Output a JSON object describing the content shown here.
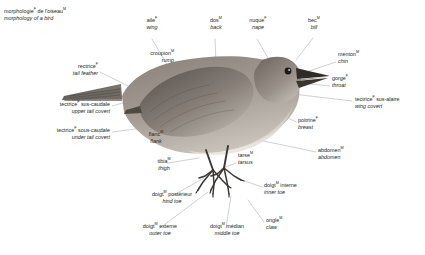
{
  "title": {
    "fr": "morphologie",
    "fr_gender": "F",
    "fr_rest": " de l'oiseau",
    "fr_gender2": "M",
    "en": "morphology of a bird"
  },
  "colors": {
    "text": "#231f20",
    "leader_line": "#a7a9ac",
    "bird_dark": "#4a4440",
    "bird_mid": "#7c736c",
    "bird_light": "#b8b2ab",
    "bird_pale": "#d8d4cf",
    "eye": "#1a1a1a"
  },
  "labels": [
    {
      "id": "aile",
      "fr": "aile",
      "fr_sup": "F",
      "fr_rest": "",
      "en": "wing",
      "align": "center"
    },
    {
      "id": "dos",
      "fr": "dos",
      "fr_sup": "M",
      "fr_rest": "",
      "en": "back",
      "align": "center"
    },
    {
      "id": "nuque",
      "fr": "nuque",
      "fr_sup": "F",
      "fr_rest": "",
      "en": "nape",
      "align": "center"
    },
    {
      "id": "bec",
      "fr": "bec",
      "fr_sup": "M",
      "fr_rest": "",
      "en": "bill",
      "align": "center"
    },
    {
      "id": "menton",
      "fr": "menton",
      "fr_sup": "M",
      "fr_rest": "",
      "en": "chin",
      "align": "left"
    },
    {
      "id": "gorge",
      "fr": "gorge",
      "fr_sup": "F",
      "fr_rest": "",
      "en": "throat",
      "align": "left"
    },
    {
      "id": "tectrice-sus-alaire",
      "fr": "tectrice",
      "fr_sup": "F",
      "fr_rest": " sus-alaire",
      "en": "wing covert",
      "align": "left"
    },
    {
      "id": "poitrine",
      "fr": "poitrine",
      "fr_sup": "F",
      "fr_rest": "",
      "en": "breast",
      "align": "left"
    },
    {
      "id": "abdomen",
      "fr": "abdomen",
      "fr_sup": "M",
      "fr_rest": "",
      "en": "abdomen",
      "align": "left"
    },
    {
      "id": "doigt-interne",
      "fr": "doigt",
      "fr_sup": "M",
      "fr_rest": " interne",
      "en": "inner toe",
      "align": "left"
    },
    {
      "id": "ongle",
      "fr": "ongle",
      "fr_sup": "M",
      "fr_rest": "",
      "en": "claw",
      "align": "left"
    },
    {
      "id": "doigt-median",
      "fr": "doigt",
      "fr_sup": "M",
      "fr_rest": " médian",
      "en": "middle toe",
      "align": "center"
    },
    {
      "id": "doigt-externe",
      "fr": "doigt",
      "fr_sup": "M",
      "fr_rest": " externe",
      "en": "outer toe",
      "align": "center"
    },
    {
      "id": "doigt-posterieur",
      "fr": "doigt",
      "fr_sup": "M",
      "fr_rest": " postérieur",
      "en": "hind toe",
      "align": "center"
    },
    {
      "id": "tibia",
      "fr": "tibia",
      "fr_sup": "M",
      "fr_rest": "",
      "en": "thigh",
      "align": "center"
    },
    {
      "id": "tarse",
      "fr": "tarse",
      "fr_sup": "M",
      "fr_rest": "",
      "en": "tarsus",
      "align": "left"
    },
    {
      "id": "flanc",
      "fr": "flanc",
      "fr_sup": "M",
      "fr_rest": "",
      "en": "flank",
      "align": "center"
    },
    {
      "id": "tectrice-sous-caudale",
      "fr": "tectrice",
      "fr_sup": "F",
      "fr_rest": " sous-caudale",
      "en": "under tail covert",
      "align": "right"
    },
    {
      "id": "tectrice-sus-caudale",
      "fr": "tectrice",
      "fr_sup": "F",
      "fr_rest": " sus-caudale",
      "en": "upper tail covert",
      "align": "right"
    },
    {
      "id": "rectrice",
      "fr": "rectrice",
      "fr_sup": "F",
      "fr_rest": "",
      "en": "tail feather",
      "align": "right"
    },
    {
      "id": "croupion",
      "fr": "croupion",
      "fr_sup": "M",
      "fr_rest": "",
      "en": "rump",
      "align": "right"
    }
  ]
}
